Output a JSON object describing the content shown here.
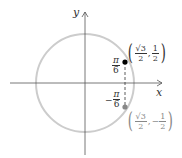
{
  "diagram": {
    "axes": {
      "x_label": "x",
      "y_label": "y"
    },
    "circle": {
      "type": "unit-circle",
      "color": "#cccccc"
    },
    "points": [
      {
        "name": "upper",
        "angle_label_num": "π",
        "angle_label_den": "6",
        "angle_sign": "",
        "coord_x_num": "√3",
        "coord_x_den": "2",
        "coord_y_sign": "",
        "coord_y_num": "1",
        "coord_y_den": "2",
        "color": "#000000"
      },
      {
        "name": "lower",
        "angle_label_num": "π",
        "angle_label_den": "6",
        "angle_sign": "−",
        "coord_x_num": "√3",
        "coord_x_den": "2",
        "coord_y_sign": "−",
        "coord_y_num": "1",
        "coord_y_den": "2",
        "color": "#888888"
      }
    ],
    "colors": {
      "axes": "#555555",
      "circle": "#cccccc",
      "dashed": "#333333"
    }
  }
}
